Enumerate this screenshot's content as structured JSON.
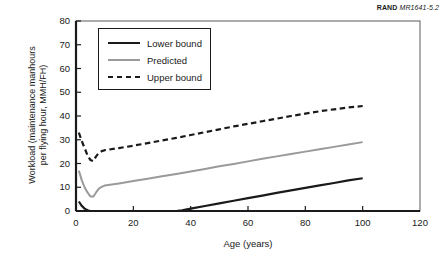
{
  "source": {
    "brand": "RAND",
    "code": "MR1641-5.2"
  },
  "chart_data": {
    "type": "line",
    "title": "",
    "xlabel": "Age (years)",
    "ylabel": "Workload (maintenance manhours per flying hour, MMH/FH)",
    "ylabel_line1": "Workload (maintenance manhours",
    "ylabel_line2": "per flying hour, MMH/FH)",
    "xlim": [
      0,
      120
    ],
    "ylim": [
      0,
      80
    ],
    "xticks": [
      0,
      20,
      40,
      60,
      80,
      100,
      120
    ],
    "yticks": [
      0,
      10,
      20,
      30,
      40,
      50,
      60,
      70,
      80
    ],
    "xtick_labels": [
      "0",
      "20",
      "40",
      "60",
      "80",
      "100",
      "120"
    ],
    "ytick_labels": [
      "0",
      "10",
      "20",
      "30",
      "40",
      "50",
      "60",
      "70",
      "80"
    ],
    "grid": false,
    "legend_position": "upper-left-inside",
    "series": [
      {
        "name": "Lower bound",
        "style": "solid",
        "color": "#1a1a1a",
        "x": [
          1,
          2,
          3,
          4,
          5,
          6,
          8,
          10,
          15,
          20,
          25,
          30,
          35,
          37,
          40,
          45,
          50,
          55,
          60,
          65,
          70,
          75,
          80,
          85,
          90,
          95,
          100
        ],
        "y": [
          4.0,
          2.2,
          1.0,
          0.3,
          0.0,
          0.0,
          0.0,
          0.0,
          0.0,
          0.0,
          0.0,
          0.0,
          0.0,
          0.3,
          1.0,
          2.1,
          3.2,
          4.3,
          5.4,
          6.5,
          7.6,
          8.7,
          9.7,
          10.8,
          11.8,
          12.9,
          13.8
        ]
      },
      {
        "name": "Predicted",
        "style": "solid",
        "color": "#9a9a9a",
        "x": [
          1,
          2,
          3,
          4,
          5,
          6,
          7,
          8,
          9,
          10,
          15,
          20,
          25,
          30,
          35,
          40,
          45,
          50,
          55,
          60,
          65,
          70,
          75,
          80,
          85,
          90,
          95,
          100
        ],
        "y": [
          17.0,
          13.0,
          10.0,
          7.8,
          6.2,
          6.0,
          7.8,
          9.4,
          10.2,
          10.7,
          11.6,
          12.6,
          13.6,
          14.6,
          15.6,
          16.6,
          17.7,
          18.8,
          19.8,
          20.9,
          22.0,
          23.0,
          24.0,
          25.0,
          26.0,
          27.0,
          28.0,
          29.0
        ]
      },
      {
        "name": "Upper bound",
        "style": "dashed",
        "color": "#1a1a1a",
        "x": [
          1,
          2,
          3,
          4,
          5,
          6,
          7,
          8,
          9,
          10,
          15,
          20,
          25,
          30,
          35,
          40,
          45,
          50,
          55,
          60,
          65,
          70,
          75,
          80,
          85,
          90,
          95,
          100
        ],
        "y": [
          33.0,
          29.5,
          26.5,
          23.5,
          21.5,
          21.0,
          23.0,
          24.5,
          25.2,
          25.6,
          26.5,
          27.5,
          28.6,
          29.7,
          30.8,
          32.0,
          33.2,
          34.4,
          35.6,
          36.7,
          37.8,
          38.9,
          40.0,
          41.0,
          42.0,
          42.8,
          43.6,
          44.2
        ]
      }
    ]
  }
}
